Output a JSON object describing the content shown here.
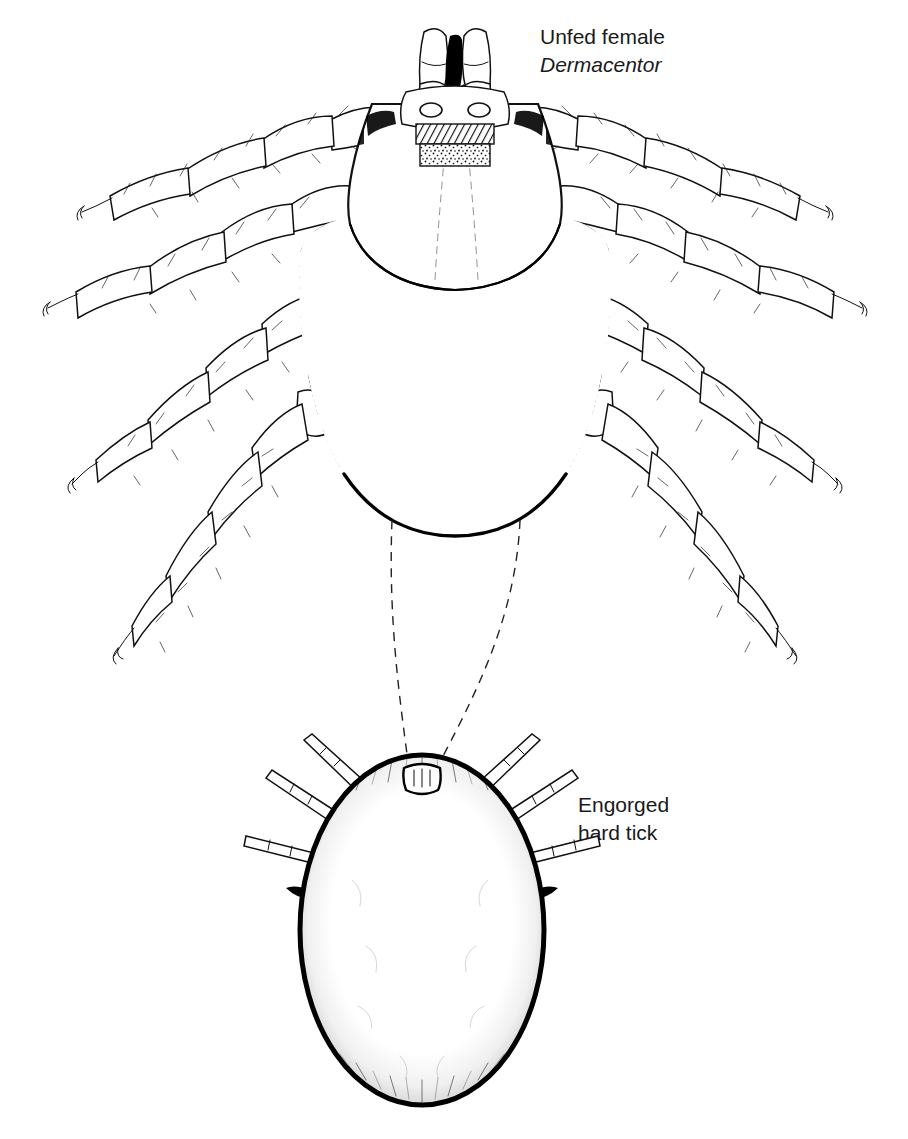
{
  "figure": {
    "background_color": "#ffffff",
    "ink_color": "#111111",
    "kind": "scientific line illustration"
  },
  "labels": {
    "unfed": {
      "line1": "Unfed female",
      "line2": "Dermacentor",
      "line2_style": "italic",
      "x": 540,
      "y": 44
    },
    "engorged": {
      "line1": "Engorged",
      "line2": "hard tick",
      "x": 578,
      "y": 812
    }
  },
  "specimens": [
    {
      "id": "unfed-female-dermacentor",
      "name": "Unfed female Dermacentor",
      "view": "dorsal",
      "center_x": 455,
      "body_top": 28,
      "body_bottom": 536,
      "leg_pairs": 4,
      "parts": [
        "capitulum",
        "palps",
        "hypostome",
        "basis-capituli",
        "porose-areas",
        "scutum",
        "opisthosoma",
        "festoons",
        "ornamentation",
        "legs",
        "coxae",
        "claws"
      ]
    },
    {
      "id": "engorged-hard-tick",
      "name": "Engorged hard tick",
      "view": "dorsal",
      "center_x": 422,
      "body_top": 755,
      "body_bottom": 1105,
      "leg_pairs": 4,
      "parts": [
        "capitulum",
        "distended-idiosoma",
        "marginal-hatching",
        "legs"
      ]
    }
  ],
  "connectors": {
    "type": "dashed",
    "count": 2,
    "description": "dashed lines linking unfed body margin to engorged capitulum"
  }
}
